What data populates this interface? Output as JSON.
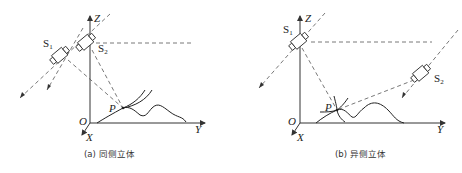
{
  "figure": {
    "panels": [
      {
        "id": "a",
        "caption": "(a) 同侧立体",
        "axes": {
          "z": "Z",
          "y": "Y",
          "x": "X",
          "origin": "O"
        },
        "cameras": [
          {
            "label": "S",
            "sub": "1"
          },
          {
            "label": "S",
            "sub": "2"
          }
        ],
        "point": "P"
      },
      {
        "id": "b",
        "caption": "(b) 异侧立体",
        "axes": {
          "z": "Z",
          "y": "Y",
          "x": "X",
          "origin": "O"
        },
        "cameras": [
          {
            "label": "S",
            "sub": "1"
          },
          {
            "label": "S",
            "sub": "2"
          }
        ],
        "point": "P"
      }
    ]
  }
}
